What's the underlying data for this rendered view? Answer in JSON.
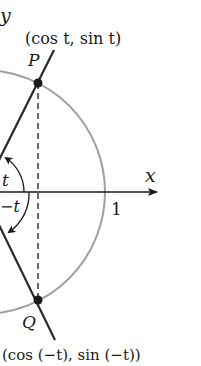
{
  "diagram": {
    "axes": {
      "x_label": "x",
      "y_label": "y",
      "unit_tick_label": "1"
    },
    "points": {
      "P": {
        "name": "P",
        "coordinates_label": "(cos t, sin t)"
      },
      "Q": {
        "name": "Q",
        "coordinates_label": "(cos (−t), sin (−t))"
      }
    },
    "angles": {
      "positive": "t",
      "negative": "−t"
    },
    "colors": {
      "circle": "#a0a0a0",
      "lines": "#2a2a2a",
      "points": "#1a1a1a",
      "text": "#1a1a1a"
    }
  }
}
